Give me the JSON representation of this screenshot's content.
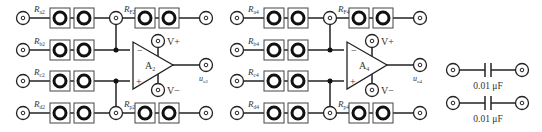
{
  "circuits": [
    {
      "amp": {
        "name": "A",
        "sub": "2"
      },
      "inputs": [
        {
          "name": "R",
          "sub": "a2"
        },
        {
          "name": "R",
          "sub": "b2"
        },
        {
          "name": "R",
          "sub": "c2"
        },
        {
          "name": "R",
          "sub": "d2"
        }
      ],
      "feedback": {
        "name": "R",
        "sub": "F2"
      },
      "ground": {
        "name": "R",
        "sub": "p2"
      },
      "output": {
        "name": "u",
        "sub": "o2"
      },
      "vplus": "V+",
      "vminus": "V−",
      "minus_sign": "−",
      "plus_sign": "+"
    },
    {
      "amp": {
        "name": "A",
        "sub": "4"
      },
      "inputs": [
        {
          "name": "R",
          "sub": "a4"
        },
        {
          "name": "R",
          "sub": "b4"
        },
        {
          "name": "R",
          "sub": "c4"
        },
        {
          "name": "R",
          "sub": "d4"
        }
      ],
      "feedback": {
        "name": "R",
        "sub": "F4"
      },
      "ground": {
        "name": "R",
        "sub": "p4"
      },
      "output": {
        "name": "u",
        "sub": "o4"
      },
      "vplus": "V+",
      "vminus": "V−",
      "minus_sign": "−",
      "plus_sign": "+"
    }
  ],
  "capacitors": [
    {
      "value": "0.01 μF"
    },
    {
      "value": "0.01 μF"
    }
  ]
}
